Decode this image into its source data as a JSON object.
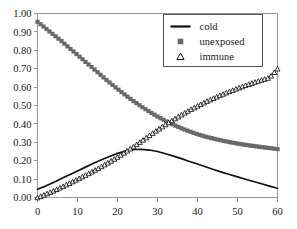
{
  "chart_data": {
    "type": "line",
    "title": "",
    "xlabel": "",
    "ylabel": "",
    "xlim": [
      0,
      60
    ],
    "ylim": [
      0.0,
      1.0
    ],
    "grid": false,
    "legend_position": "top-right",
    "x_ticks": [
      "0",
      "10",
      "20",
      "30",
      "40",
      "50",
      "60"
    ],
    "x_tick_values": [
      0,
      10,
      20,
      30,
      40,
      50,
      60
    ],
    "y_ticks": [
      "0.00",
      "0.10",
      "0.20",
      "0.30",
      "0.40",
      "0.50",
      "0.60",
      "0.70",
      "0.80",
      "0.90",
      "1.00"
    ],
    "y_tick_values": [
      0.0,
      0.1,
      0.2,
      0.3,
      0.4,
      0.5,
      0.6,
      0.7,
      0.8,
      0.9,
      1.0
    ],
    "x": [
      0,
      2,
      4,
      6,
      8,
      10,
      12,
      14,
      16,
      18,
      20,
      22,
      24,
      26,
      28,
      30,
      32,
      34,
      36,
      38,
      40,
      42,
      44,
      46,
      48,
      50,
      52,
      54,
      56,
      58,
      60
    ],
    "series": [
      {
        "name": "cold",
        "marker": "none",
        "style": "solid-line",
        "color": "#111111",
        "values": [
          0.045,
          0.062,
          0.082,
          0.103,
          0.124,
          0.144,
          0.165,
          0.186,
          0.205,
          0.223,
          0.24,
          0.253,
          0.261,
          0.262,
          0.258,
          0.25,
          0.238,
          0.225,
          0.211,
          0.196,
          0.182,
          0.167,
          0.152,
          0.138,
          0.125,
          0.112,
          0.099,
          0.087,
          0.075,
          0.062,
          0.05
        ]
      },
      {
        "name": "unexposed",
        "marker": "square",
        "style": "markers",
        "color": "#696969",
        "values": [
          0.955,
          0.92,
          0.885,
          0.85,
          0.812,
          0.775,
          0.737,
          0.7,
          0.662,
          0.625,
          0.59,
          0.556,
          0.524,
          0.494,
          0.466,
          0.44,
          0.416,
          0.395,
          0.376,
          0.359,
          0.344,
          0.331,
          0.32,
          0.31,
          0.301,
          0.293,
          0.286,
          0.28,
          0.274,
          0.269,
          0.263
        ]
      },
      {
        "name": "immune",
        "marker": "triangle-open",
        "style": "markers",
        "color": "#111111",
        "values": [
          0.0,
          0.018,
          0.037,
          0.057,
          0.078,
          0.1,
          0.122,
          0.145,
          0.169,
          0.194,
          0.22,
          0.248,
          0.277,
          0.307,
          0.338,
          0.368,
          0.397,
          0.424,
          0.45,
          0.475,
          0.498,
          0.52,
          0.54,
          0.559,
          0.577,
          0.594,
          0.61,
          0.625,
          0.639,
          0.652,
          0.7
        ]
      }
    ],
    "legend": [
      {
        "label": "cold",
        "marker": "line",
        "color": "#111111"
      },
      {
        "label": "unexposed",
        "marker": "square",
        "color": "#696969"
      },
      {
        "label": "immune",
        "marker": "triangle-open",
        "color": "#111111"
      }
    ],
    "axis_color": "#999999",
    "text_color": "#1a1a1a"
  }
}
